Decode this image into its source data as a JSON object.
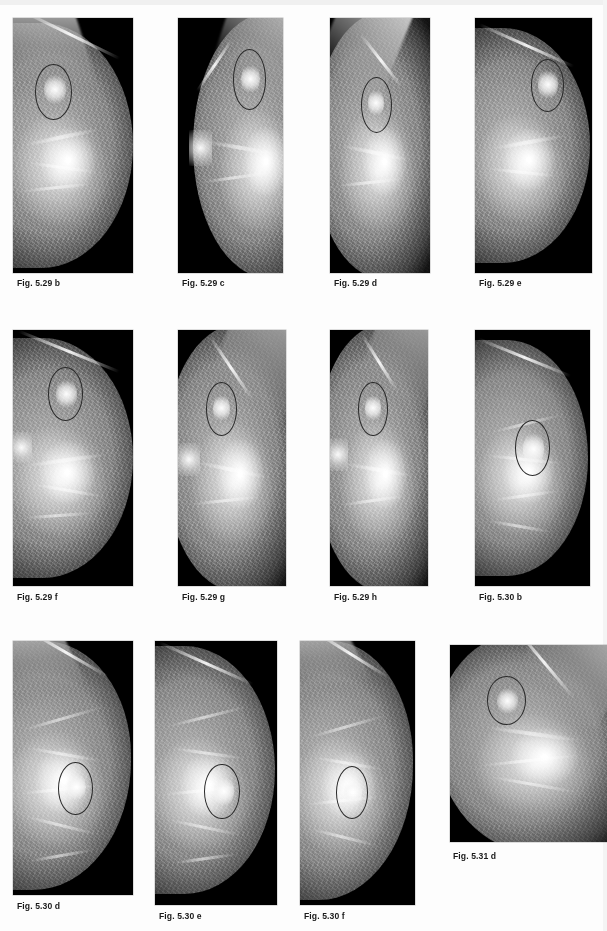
{
  "page": {
    "background_color": "#fdfdfd",
    "width": 607,
    "height": 931,
    "caption_color": "#1a1a1a",
    "marker_ring_color": "#2a2a2a",
    "plate_background_color": "#000000"
  },
  "figures": [
    {
      "id": "fig-5-29-b",
      "caption": "Fig. 5.29 b",
      "view": "craniocaudal",
      "row": 1,
      "column": 1,
      "plate": {
        "x": 13,
        "y": 18,
        "width": 120,
        "height": 255
      },
      "caption_pos": {
        "x": 17,
        "y": 278
      },
      "marker": {
        "cx": 0.34,
        "cy": 0.29,
        "r": 0.155
      },
      "orientation": "left"
    },
    {
      "id": "fig-5-29-c",
      "caption": "Fig. 5.29 c",
      "view": "mediolateral-oblique",
      "row": 1,
      "column": 2,
      "plate": {
        "x": 178,
        "y": 18,
        "width": 105,
        "height": 255
      },
      "caption_pos": {
        "x": 182,
        "y": 278
      },
      "marker": {
        "cx": 0.68,
        "cy": 0.24,
        "r": 0.16
      },
      "orientation": "right"
    },
    {
      "id": "fig-5-29-d",
      "caption": "Fig. 5.29 d",
      "view": "mediolateral-oblique",
      "row": 1,
      "column": 3,
      "plate": {
        "x": 330,
        "y": 18,
        "width": 100,
        "height": 255
      },
      "caption_pos": {
        "x": 334,
        "y": 278
      },
      "marker": {
        "cx": 0.46,
        "cy": 0.34,
        "r": 0.155
      },
      "orientation": "right"
    },
    {
      "id": "fig-5-29-e",
      "caption": "Fig. 5.29 e",
      "view": "craniocaudal",
      "row": 1,
      "column": 4,
      "plate": {
        "x": 475,
        "y": 18,
        "width": 117,
        "height": 255
      },
      "caption_pos": {
        "x": 479,
        "y": 278
      },
      "marker": {
        "cx": 0.62,
        "cy": 0.27,
        "r": 0.145
      },
      "orientation": "left"
    },
    {
      "id": "fig-5-29-f",
      "caption": "Fig. 5.29 f",
      "view": "craniocaudal",
      "row": 2,
      "column": 1,
      "plate": {
        "x": 13,
        "y": 330,
        "width": 120,
        "height": 256
      },
      "caption_pos": {
        "x": 17,
        "y": 592
      },
      "marker": {
        "cx": 0.44,
        "cy": 0.25,
        "r": 0.145
      },
      "orientation": "left"
    },
    {
      "id": "fig-5-29-g",
      "caption": "Fig. 5.29 g",
      "view": "mediolateral-oblique",
      "row": 2,
      "column": 2,
      "plate": {
        "x": 178,
        "y": 330,
        "width": 108,
        "height": 256
      },
      "caption_pos": {
        "x": 182,
        "y": 592
      },
      "marker": {
        "cx": 0.4,
        "cy": 0.31,
        "r": 0.145
      },
      "orientation": "right"
    },
    {
      "id": "fig-5-29-h",
      "caption": "Fig. 5.29 h",
      "view": "mediolateral-oblique",
      "row": 2,
      "column": 3,
      "plate": {
        "x": 330,
        "y": 330,
        "width": 98,
        "height": 256
      },
      "caption_pos": {
        "x": 334,
        "y": 592
      },
      "marker": {
        "cx": 0.44,
        "cy": 0.31,
        "r": 0.15
      },
      "orientation": "right"
    },
    {
      "id": "fig-5-30-b",
      "caption": "Fig. 5.30 b",
      "view": "craniocaudal",
      "row": 2,
      "column": 4,
      "plate": {
        "x": 475,
        "y": 330,
        "width": 115,
        "height": 256
      },
      "caption_pos": {
        "x": 479,
        "y": 592
      },
      "marker": {
        "cx": 0.5,
        "cy": 0.46,
        "r": 0.155
      },
      "orientation": "left"
    },
    {
      "id": "fig-5-30-d",
      "caption": "Fig. 5.30 d",
      "view": "mediolateral-oblique",
      "row": 3,
      "column": 1,
      "plate": {
        "x": 13,
        "y": 641,
        "width": 120,
        "height": 254
      },
      "caption_pos": {
        "x": 17,
        "y": 901
      },
      "marker": {
        "cx": 0.52,
        "cy": 0.57,
        "r": 0.145
      },
      "orientation": "left"
    },
    {
      "id": "fig-5-30-e",
      "caption": "Fig. 5.30 e",
      "view": "craniocaudal",
      "row": 3,
      "column": 2,
      "plate": {
        "x": 155,
        "y": 641,
        "width": 122,
        "height": 264
      },
      "caption_pos": {
        "x": 159,
        "y": 911
      },
      "marker": {
        "cx": 0.55,
        "cy": 0.56,
        "r": 0.145
      },
      "orientation": "left"
    },
    {
      "id": "fig-5-30-f",
      "caption": "Fig. 5.30 f",
      "view": "mediolateral-oblique",
      "row": 3,
      "column": 3,
      "plate": {
        "x": 300,
        "y": 641,
        "width": 115,
        "height": 264
      },
      "caption_pos": {
        "x": 304,
        "y": 911
      },
      "marker": {
        "cx": 0.45,
        "cy": 0.57,
        "r": 0.14
      },
      "orientation": "left"
    },
    {
      "id": "fig-5-31-d",
      "caption": "Fig. 5.31 d",
      "view": "mediolateral-oblique",
      "row": 3,
      "column": 4,
      "plate": {
        "x": 450,
        "y": 645,
        "width": 157,
        "height": 197
      },
      "caption_pos": {
        "x": 453,
        "y": 851
      },
      "marker": {
        "cx": 0.36,
        "cy": 0.28,
        "r": 0.125
      },
      "orientation": "right"
    }
  ]
}
